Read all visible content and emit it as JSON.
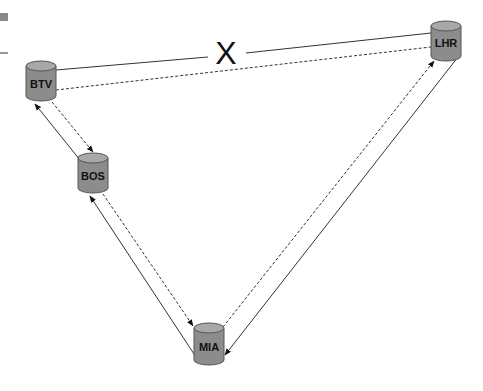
{
  "diagram": {
    "type": "network-topology",
    "cut_marker": "X",
    "colors": {
      "node_fill": "#8c8c8c",
      "node_top": "#a8a8a8",
      "node_stroke": "#555555",
      "line": "#333333",
      "corner_block": "#8a8a8a"
    },
    "nodes": [
      {
        "id": "BTV",
        "label": "BTV"
      },
      {
        "id": "BOS",
        "label": "BOS"
      },
      {
        "id": "MIA",
        "label": "MIA"
      },
      {
        "id": "LHR",
        "label": "LHR"
      }
    ],
    "links": [
      {
        "from": "BTV",
        "to": "LHR",
        "style": "solid",
        "arrow": "none",
        "status": "cut"
      },
      {
        "from": "BTV",
        "to": "LHR",
        "style": "dashed",
        "arrow": "none"
      },
      {
        "from": "BOS",
        "to": "BTV",
        "style": "solid",
        "arrow": "end"
      },
      {
        "from": "BTV",
        "to": "BOS",
        "style": "dashed",
        "arrow": "end"
      },
      {
        "from": "MIA",
        "to": "BOS",
        "style": "solid",
        "arrow": "end"
      },
      {
        "from": "BOS",
        "to": "MIA",
        "style": "dashed",
        "arrow": "end"
      },
      {
        "from": "LHR",
        "to": "MIA",
        "style": "solid",
        "arrow": "end"
      },
      {
        "from": "MIA",
        "to": "LHR",
        "style": "dashed",
        "arrow": "end"
      }
    ]
  }
}
